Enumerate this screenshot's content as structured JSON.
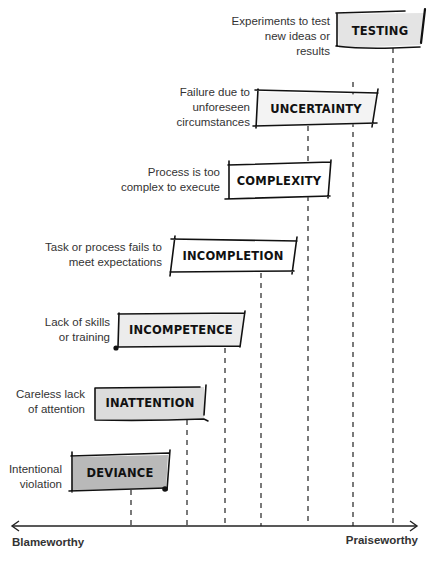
{
  "diagram": {
    "type": "spectrum",
    "axis": {
      "left_label": "Blameworthy",
      "right_label": "Praiseworthy"
    },
    "categories": [
      {
        "name": "TESTING",
        "description_line1": "Experiments to test",
        "description_line2": "new ideas or results",
        "description_line3": "",
        "fill": "#e4e4e4"
      },
      {
        "name": "UNCERTAINTY",
        "description_line1": "Failure due to",
        "description_line2": "unforeseen",
        "description_line3": "circumstances",
        "fill": "#f3f3f3"
      },
      {
        "name": "COMPLEXITY",
        "description_line1": "Process is too",
        "description_line2": "complex to execute",
        "description_line3": "",
        "fill": "#ffffff"
      },
      {
        "name": "INCOMPLETION",
        "description_line1": "Task or process fails to",
        "description_line2": "meet expectations",
        "description_line3": "",
        "fill": "#ffffff"
      },
      {
        "name": "INCOMPETENCE",
        "description_line1": "Lack of skills",
        "description_line2": "or training",
        "description_line3": "",
        "fill": "#ececec"
      },
      {
        "name": "INATTENTION",
        "description_line1": "Careless lack",
        "description_line2": "of attention",
        "description_line3": "",
        "fill": "#dcdcdc"
      },
      {
        "name": "DEVIANCE",
        "description_line1": "Intentional",
        "description_line2": "violation",
        "description_line3": "",
        "fill": "#b9b9b9"
      }
    ]
  }
}
